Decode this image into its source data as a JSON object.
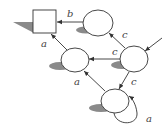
{
  "diagram": {
    "type": "state-machine",
    "states": [
      {
        "id": "s_final",
        "shape": "square",
        "label": ""
      },
      {
        "id": "s_top",
        "shape": "circle",
        "label": ""
      },
      {
        "id": "s_mid",
        "shape": "circle",
        "label": ""
      },
      {
        "id": "s_right",
        "shape": "circle",
        "label": "",
        "initial": true
      },
      {
        "id": "s_bottom",
        "shape": "circle",
        "label": ""
      }
    ],
    "transitions": [
      {
        "from": "s_top",
        "to": "s_final",
        "label": "b"
      },
      {
        "from": "s_mid",
        "to": "s_final",
        "label": "a"
      },
      {
        "from": "s_right",
        "to": "s_top",
        "label": "c"
      },
      {
        "from": "s_right",
        "to": "s_mid",
        "label": "c"
      },
      {
        "from": "s_right",
        "to": "s_bottom",
        "label": "c"
      },
      {
        "from": "s_bottom",
        "to": "s_mid",
        "label": "a"
      },
      {
        "from": "s_bottom",
        "to": "s_bottom",
        "label": "a"
      }
    ],
    "labels": {
      "b_top": "b",
      "a_left": "a",
      "c_upper": "c",
      "c_middle": "c",
      "c_lower": "c",
      "a_middle": "a",
      "a_loop": "a"
    },
    "colors": {
      "stroke": "#333333",
      "shadow": "#8a8a8a",
      "background": "#ffffff"
    }
  }
}
